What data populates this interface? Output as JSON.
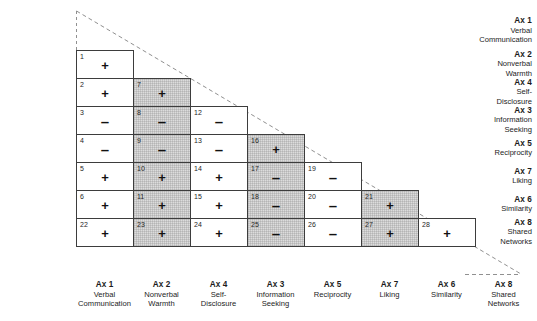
{
  "figure": {
    "type": "triangular-matrix",
    "shaded_columns": [
      "Ax 2",
      "Ax 3",
      "Ax 7"
    ],
    "sign_plus": "+",
    "sign_minus": "–"
  },
  "row_labels": [
    {
      "ax": "Ax 1",
      "desc": "Verbal\nCommunication"
    },
    {
      "ax": "Ax 2",
      "desc": "Nonverbal\nWarmth"
    },
    {
      "ax": "Ax 4",
      "desc": "Self-\nDisclosure"
    },
    {
      "ax": "Ax 3",
      "desc": "Information\nSeeking"
    },
    {
      "ax": "Ax 5",
      "desc": "Reciprocity"
    },
    {
      "ax": "Ax 7",
      "desc": "Liking"
    },
    {
      "ax": "Ax 6",
      "desc": "Similarity"
    },
    {
      "ax": "Ax 8",
      "desc": "Shared\nNetworks"
    }
  ],
  "col_labels": [
    {
      "ax": "Ax 1",
      "desc": "Verbal\nCommunication"
    },
    {
      "ax": "Ax 2",
      "desc": "Nonverbal\nWarmth"
    },
    {
      "ax": "Ax 4",
      "desc": "Self-\nDisclosure"
    },
    {
      "ax": "Ax 3",
      "desc": "Information\nSeeking"
    },
    {
      "ax": "Ax 5",
      "desc": "Reciprocity"
    },
    {
      "ax": "Ax 7",
      "desc": "Liking"
    },
    {
      "ax": "Ax 6",
      "desc": "Similarity"
    },
    {
      "ax": "Ax 8",
      "desc": "Shared\nNetworks"
    }
  ],
  "cells": [
    {
      "num": "1",
      "sign": "+",
      "row": 0,
      "col": 0,
      "shaded": false
    },
    {
      "num": "2",
      "sign": "+",
      "row": 1,
      "col": 0,
      "shaded": false
    },
    {
      "num": "7",
      "sign": "+",
      "row": 1,
      "col": 1,
      "shaded": true
    },
    {
      "num": "3",
      "sign": "–",
      "row": 2,
      "col": 0,
      "shaded": false
    },
    {
      "num": "8",
      "sign": "–",
      "row": 2,
      "col": 1,
      "shaded": true
    },
    {
      "num": "12",
      "sign": "–",
      "row": 2,
      "col": 2,
      "shaded": false
    },
    {
      "num": "4",
      "sign": "–",
      "row": 3,
      "col": 0,
      "shaded": false
    },
    {
      "num": "9",
      "sign": "–",
      "row": 3,
      "col": 1,
      "shaded": true
    },
    {
      "num": "13",
      "sign": "–",
      "row": 3,
      "col": 2,
      "shaded": false
    },
    {
      "num": "16",
      "sign": "+",
      "row": 3,
      "col": 3,
      "shaded": true
    },
    {
      "num": "5",
      "sign": "+",
      "row": 4,
      "col": 0,
      "shaded": false
    },
    {
      "num": "10",
      "sign": "+",
      "row": 4,
      "col": 1,
      "shaded": true
    },
    {
      "num": "14",
      "sign": "+",
      "row": 4,
      "col": 2,
      "shaded": false
    },
    {
      "num": "17",
      "sign": "–",
      "row": 4,
      "col": 3,
      "shaded": true
    },
    {
      "num": "19",
      "sign": "–",
      "row": 4,
      "col": 4,
      "shaded": false
    },
    {
      "num": "6",
      "sign": "+",
      "row": 5,
      "col": 0,
      "shaded": false
    },
    {
      "num": "11",
      "sign": "+",
      "row": 5,
      "col": 1,
      "shaded": true
    },
    {
      "num": "15",
      "sign": "+",
      "row": 5,
      "col": 2,
      "shaded": false
    },
    {
      "num": "18",
      "sign": "–",
      "row": 5,
      "col": 3,
      "shaded": true
    },
    {
      "num": "20",
      "sign": "–",
      "row": 5,
      "col": 4,
      "shaded": false
    },
    {
      "num": "21",
      "sign": "+",
      "row": 5,
      "col": 5,
      "shaded": true
    },
    {
      "num": "22",
      "sign": "+",
      "row": 6,
      "col": 0,
      "shaded": false
    },
    {
      "num": "23",
      "sign": "+",
      "row": 6,
      "col": 1,
      "shaded": true
    },
    {
      "num": "24",
      "sign": "+",
      "row": 6,
      "col": 2,
      "shaded": false
    },
    {
      "num": "25",
      "sign": "–",
      "row": 6,
      "col": 3,
      "shaded": true
    },
    {
      "num": "26",
      "sign": "–",
      "row": 6,
      "col": 4,
      "shaded": false
    },
    {
      "num": "27",
      "sign": "+",
      "row": 6,
      "col": 5,
      "shaded": true
    },
    {
      "num": "28",
      "sign": "+",
      "row": 6,
      "col": 6,
      "shaded": false
    }
  ]
}
